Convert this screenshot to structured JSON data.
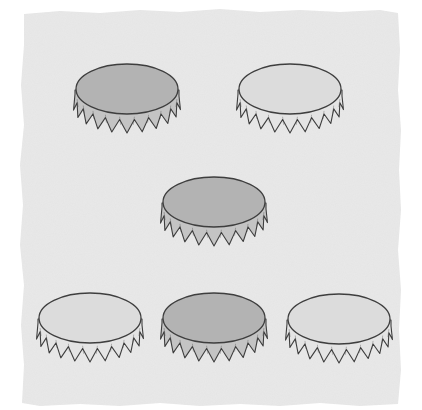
{
  "scene": {
    "description": "Illustration of six bottle caps on a gray textured paper background",
    "background_color": "#e9e9e9",
    "paper_edge_color": "#ffffff",
    "outline_color": "#3e3e3e"
  },
  "colors": {
    "dark": {
      "top": "#b3b3b3",
      "skirt": "#c4c4c4"
    },
    "light": {
      "top": "#dcdcdc",
      "skirt": "#e4e4e4"
    }
  },
  "caps": [
    {
      "id": "cap-top-left",
      "shade": "dark",
      "x": 71,
      "y": 60
    },
    {
      "id": "cap-top-right",
      "shade": "light",
      "x": 234,
      "y": 60
    },
    {
      "id": "cap-middle",
      "shade": "dark",
      "x": 158,
      "y": 173
    },
    {
      "id": "cap-bottom-left",
      "shade": "light",
      "x": 34,
      "y": 289
    },
    {
      "id": "cap-bottom-middle",
      "shade": "dark",
      "x": 158,
      "y": 289
    },
    {
      "id": "cap-bottom-right",
      "shade": "light",
      "x": 283,
      "y": 290
    }
  ],
  "counts": {
    "total": 6,
    "dark": 3,
    "light": 3
  }
}
